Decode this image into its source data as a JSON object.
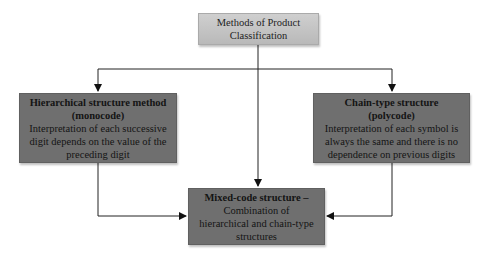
{
  "diagram": {
    "root": {
      "line1": "Methods of Product",
      "line2": "Classification"
    },
    "left": {
      "title1": "Hierarchical structure method",
      "title2": "(monocode)",
      "desc": "Interpretation of each successive digit depends on the value of the preceding digit"
    },
    "right": {
      "title1": "Chain-type structure",
      "title2": "(polycode)",
      "desc": "Interpretation of each symbol is always the same and there is no dependence on previous digits"
    },
    "bottom": {
      "title": "Mixed-code structure –",
      "desc": "Combination of hierarchical and chain-type structures"
    },
    "colors": {
      "root_fill": "#c4c4c4",
      "node_fill": "#6f6f6f",
      "line": "#222222"
    }
  }
}
